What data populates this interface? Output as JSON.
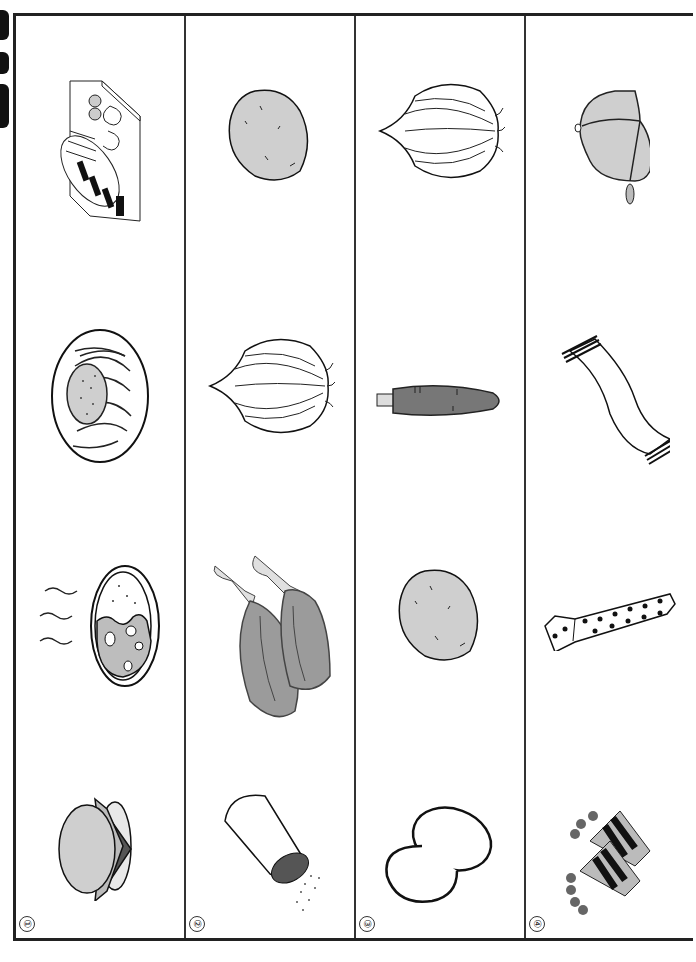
{
  "worksheet": {
    "orientation": "rotated-90-clockwise",
    "columns": [
      {
        "number": "①",
        "label_hidden": "group-1",
        "items": [
          {
            "name": "bento-box",
            "icon": "bento-icon"
          },
          {
            "name": "spaghetti-meat-sauce",
            "icon": "spaghetti-icon"
          },
          {
            "name": "curry-rice",
            "icon": "curry-icon"
          },
          {
            "name": "hamburger",
            "icon": "hamburger-icon"
          }
        ]
      },
      {
        "number": "②",
        "items": [
          {
            "name": "potato",
            "icon": "potato-icon"
          },
          {
            "name": "onion",
            "icon": "onion-icon"
          },
          {
            "name": "meat",
            "icon": "meat-icon"
          },
          {
            "name": "salt-shaker",
            "icon": "salt-shaker-icon"
          }
        ]
      },
      {
        "number": "③",
        "items": [
          {
            "name": "onion",
            "icon": "onion-icon"
          },
          {
            "name": "carrot",
            "icon": "carrot-icon"
          },
          {
            "name": "potato",
            "icon": "potato-icon"
          },
          {
            "name": "eggs",
            "icon": "eggs-icon"
          }
        ]
      },
      {
        "number": "④",
        "items": [
          {
            "name": "cap",
            "icon": "cap-icon"
          },
          {
            "name": "scarf",
            "icon": "scarf-icon"
          },
          {
            "name": "necktie",
            "icon": "necktie-icon"
          },
          {
            "name": "gloves",
            "icon": "gloves-icon"
          }
        ]
      }
    ]
  },
  "colors": {
    "border": "#222222",
    "fill_light": "#cfcfcf",
    "fill_mid": "#a8a8a8",
    "fill_dark": "#555555",
    "ink": "#111111"
  }
}
